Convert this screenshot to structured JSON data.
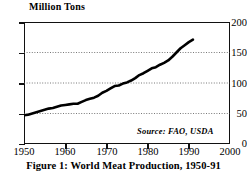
{
  "figure": {
    "caption": "Figure 1: World Meat Production, 1950-91",
    "axis_title": "Million Tons",
    "source_note": "Source: FAO, USDA"
  },
  "chart_data": {
    "type": "line",
    "title": "Figure 1: World Meat Production, 1950-91",
    "ylabel": "Million Tons",
    "xlabel": "",
    "annotation": "Source: FAO, USDA",
    "xlim": [
      1950,
      2000
    ],
    "ylim": [
      0,
      200
    ],
    "xticks": [
      1950,
      1960,
      1970,
      1980,
      1990,
      2000
    ],
    "yticks": [
      0,
      50,
      100,
      150,
      200
    ],
    "grid": true,
    "grid_style": "dotted",
    "line_color": "#000000",
    "line_width": 2.6,
    "series": [
      {
        "name": "World meat production",
        "units": "million tons",
        "x": [
          1950,
          1951,
          1952,
          1953,
          1954,
          1955,
          1956,
          1957,
          1958,
          1959,
          1960,
          1961,
          1962,
          1963,
          1964,
          1965,
          1966,
          1967,
          1968,
          1969,
          1970,
          1971,
          1972,
          1973,
          1974,
          1975,
          1976,
          1977,
          1978,
          1979,
          1980,
          1981,
          1982,
          1983,
          1984,
          1985,
          1986,
          1987,
          1988,
          1989,
          1990,
          1991
        ],
        "values": [
          47,
          48,
          50,
          52,
          54,
          56,
          58,
          59,
          61,
          63,
          64,
          65,
          66,
          66,
          69,
          72,
          74,
          76,
          79,
          84,
          87,
          91,
          95,
          96,
          99,
          101,
          104,
          108,
          113,
          116,
          120,
          124,
          126,
          130,
          133,
          137,
          143,
          150,
          157,
          162,
          167,
          171
        ]
      }
    ]
  }
}
